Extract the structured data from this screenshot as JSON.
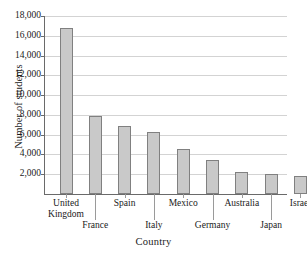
{
  "chart_data": {
    "type": "bar",
    "title": "",
    "xlabel": "Country",
    "ylabel": "Number of students",
    "categories": [
      "United Kingdom",
      "France",
      "Spain",
      "Italy",
      "Mexico",
      "Germany",
      "Australia",
      "Japan",
      "Israel"
    ],
    "values": [
      16800,
      7900,
      6900,
      6300,
      4600,
      3400,
      2200,
      2050,
      1850
    ],
    "ylim": [
      0,
      18000
    ],
    "ytick_labels": [
      "2,000",
      "4,000",
      "6,000",
      "8,000",
      "10,000",
      "12,000",
      "14,000",
      "16,000",
      "18,000"
    ],
    "ytick_values": [
      2000,
      4000,
      6000,
      8000,
      10000,
      12000,
      14000,
      16000,
      18000
    ],
    "grid": true,
    "legend": "none",
    "bar_color": "#c9c9c9",
    "bar_border_color": "#808080",
    "gridline_color": "#d3d3d3",
    "axis_color": "#6a6a6a"
  }
}
